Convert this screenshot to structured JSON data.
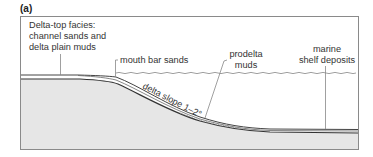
{
  "figure": {
    "panel_label": "(a)",
    "labels": {
      "delta_top": [
        "Delta-top facies:",
        "channel sands and",
        "delta plain muds"
      ],
      "mouth_bar": "mouth bar sands",
      "prodelta": [
        "prodelta",
        "muds"
      ],
      "marine_shelf": [
        "marine",
        "shelf deposits"
      ],
      "slope": "delta slope 1–2°"
    },
    "colors": {
      "frame": "#8a8a8a",
      "substrate_fill": "#e6e6e6",
      "layer_line": "#444444",
      "water_line": "#777777",
      "leader_line": "#888888",
      "text": "#333333"
    }
  }
}
